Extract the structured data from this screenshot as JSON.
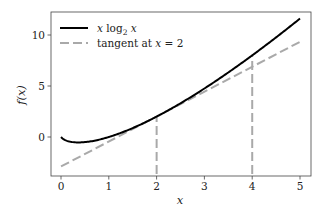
{
  "chart_data": {
    "type": "line",
    "title": "",
    "xlabel": "x",
    "ylabel": "f(x)",
    "xlim": [
      -0.21,
      5.23
    ],
    "ylim": [
      -3.82,
      12.25
    ],
    "xticks": [
      0,
      1,
      2,
      3,
      4,
      5
    ],
    "yticks": [
      0,
      5,
      10
    ],
    "xtick_labels": [
      "0",
      "1",
      "2",
      "3",
      "4",
      "5"
    ],
    "ytick_labels": [
      "0",
      "5",
      "10"
    ],
    "grid": false,
    "legend_position": "upper left",
    "series": [
      {
        "name": "x log2 x",
        "legend_label": "x log₂ x",
        "style": "solid",
        "color": "#000000",
        "x": [
          0.0,
          0.1,
          0.25,
          0.3679,
          0.5,
          0.75,
          1.0,
          1.5,
          2.0,
          2.5,
          3.0,
          3.5,
          4.0,
          4.5,
          5.0
        ],
        "y": [
          0.0,
          -0.332,
          -0.5,
          -0.531,
          -0.5,
          -0.311,
          0.0,
          0.877,
          2.0,
          3.305,
          4.755,
          6.326,
          8.0,
          9.765,
          11.61
        ]
      },
      {
        "name": "tangent at x = 2",
        "legend_label": "tangent at x = 2",
        "style": "dashed",
        "color": "#a9a9a9",
        "x": [
          0,
          5
        ],
        "y": [
          -2.885,
          9.328
        ]
      }
    ],
    "annotations": [
      {
        "type": "vline",
        "style": "dashed",
        "color": "#a9a9a9",
        "x": 2,
        "y_from": -3.82,
        "y_to": 2.0
      },
      {
        "type": "vline",
        "style": "dashed",
        "color": "#a9a9a9",
        "x": 4,
        "y_from": -3.82,
        "y_to": 8.0
      }
    ]
  },
  "legend": {
    "item1": "x log",
    "item1_sub": "2",
    "item1_tail": " x",
    "item2": "tangent at ",
    "item2_var": "x",
    "item2_tail": " = 2"
  },
  "axes": {
    "xlabel": "x",
    "ylabel": "f(x)",
    "xticks": [
      "0",
      "1",
      "2",
      "3",
      "4",
      "5"
    ],
    "yticks": [
      "0",
      "5",
      "10"
    ]
  }
}
